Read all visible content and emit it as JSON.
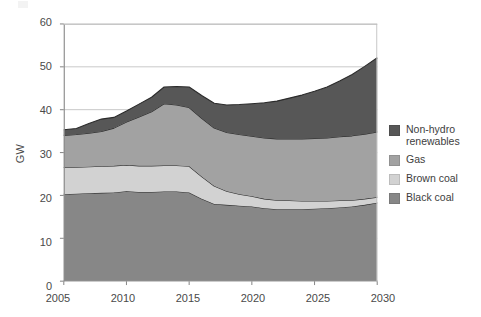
{
  "chart_data": {
    "type": "area",
    "stacked": true,
    "title": "",
    "xlabel": "",
    "ylabel": "GW",
    "xlim": [
      2005,
      2030
    ],
    "ylim": [
      0,
      60
    ],
    "yticks": [
      0,
      10,
      20,
      30,
      40,
      50,
      60
    ],
    "xticks": [
      2005,
      2010,
      2015,
      2020,
      2025,
      2030
    ],
    "grid": "horizontal",
    "legend_position": "right",
    "x": [
      2005,
      2006,
      2007,
      2008,
      2009,
      2010,
      2011,
      2012,
      2013,
      2014,
      2015,
      2016,
      2017,
      2018,
      2019,
      2020,
      2021,
      2022,
      2023,
      2024,
      2025,
      2026,
      2027,
      2028,
      2029,
      2030
    ],
    "series": [
      {
        "name": "Black coal",
        "color": "#878787",
        "values": [
          20.3,
          20.4,
          20.5,
          20.6,
          20.7,
          21.0,
          20.8,
          20.8,
          20.9,
          20.9,
          20.7,
          19.2,
          18.0,
          17.8,
          17.6,
          17.4,
          17.0,
          16.8,
          16.8,
          16.8,
          16.9,
          17.0,
          17.2,
          17.4,
          17.8,
          18.3
        ]
      },
      {
        "name": "Brown coal",
        "color": "#d2d2d2",
        "values": [
          6.2,
          6.2,
          6.2,
          6.2,
          6.2,
          6.1,
          6.1,
          6.1,
          6.1,
          6.1,
          6.1,
          5.2,
          4.2,
          3.2,
          2.7,
          2.4,
          2.2,
          2.1,
          2.0,
          1.9,
          1.8,
          1.7,
          1.6,
          1.5,
          1.4,
          1.3
        ]
      },
      {
        "name": "Gas",
        "color": "#a2a2a2",
        "values": [
          7.5,
          7.6,
          7.8,
          8.1,
          8.8,
          10.0,
          11.4,
          12.6,
          14.4,
          14.1,
          13.7,
          13.6,
          13.5,
          13.7,
          13.9,
          14.0,
          14.2,
          14.3,
          14.4,
          14.5,
          14.6,
          14.7,
          14.9,
          15.0,
          15.1,
          15.2
        ]
      },
      {
        "name": "Non-hydro renewables",
        "color": "#575757",
        "values": [
          1.3,
          1.4,
          2.3,
          2.9,
          2.5,
          2.6,
          3.0,
          3.4,
          3.9,
          4.3,
          4.8,
          5.3,
          5.8,
          6.4,
          7.0,
          7.6,
          8.2,
          8.8,
          9.5,
          10.2,
          11.0,
          11.9,
          13.0,
          14.3,
          15.8,
          17.3
        ]
      }
    ],
    "stack_order_bottom_to_top": [
      "Black coal",
      "Brown coal",
      "Gas",
      "Non-hydro renewables"
    ]
  },
  "axes": {
    "y_title": "GW",
    "y_ticks": [
      "60",
      "50",
      "40",
      "30",
      "20",
      "10",
      "0"
    ],
    "x_ticks": [
      "2005",
      "2010",
      "2015",
      "2020",
      "2025",
      "2030"
    ]
  },
  "legend": {
    "items": [
      {
        "label": "Non-hydro\nrenewables",
        "color": "#575757",
        "name": "non-hydro-renewables"
      },
      {
        "label": "Gas",
        "color": "#a2a2a2",
        "name": "gas"
      },
      {
        "label": "Brown coal",
        "color": "#d2d2d2",
        "name": "brown-coal"
      },
      {
        "label": "Black coal",
        "color": "#878787",
        "name": "black-coal"
      }
    ]
  },
  "style": {
    "axis_color": "#8c8c8c",
    "grid_color": "#bfbfbf",
    "outline_color": "#2b2b2b",
    "background": "#ffffff"
  }
}
